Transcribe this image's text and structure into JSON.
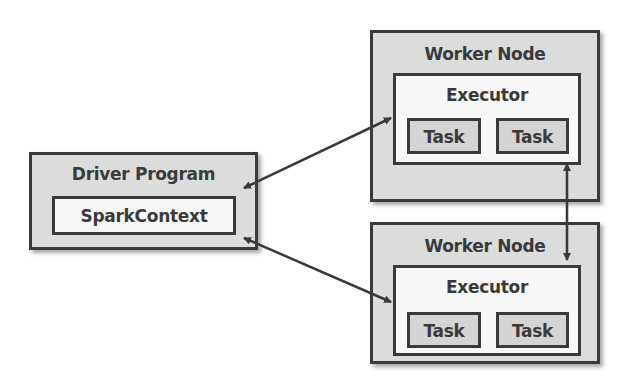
{
  "diagram": {
    "driver": {
      "title": "Driver Program",
      "context": "SparkContext"
    },
    "workers": [
      {
        "title": "Worker Node",
        "executor": "Executor",
        "tasks": [
          "Task",
          "Task"
        ]
      },
      {
        "title": "Worker Node",
        "executor": "Executor",
        "tasks": [
          "Task",
          "Task"
        ]
      }
    ],
    "connections": [
      {
        "from": "SparkContext",
        "to": "Worker Node 1 Executor",
        "bidirectional": true
      },
      {
        "from": "SparkContext",
        "to": "Worker Node 2 Executor",
        "bidirectional": true
      },
      {
        "from": "Worker Node 1 Executor",
        "to": "Worker Node 2 Executor",
        "bidirectional": true
      }
    ],
    "colors": {
      "outer_fill": "#dcdcdc",
      "inner_fill": "#f7f7f7",
      "task_fill": "#d4d4d4",
      "stroke": "#3a3a3a"
    }
  }
}
